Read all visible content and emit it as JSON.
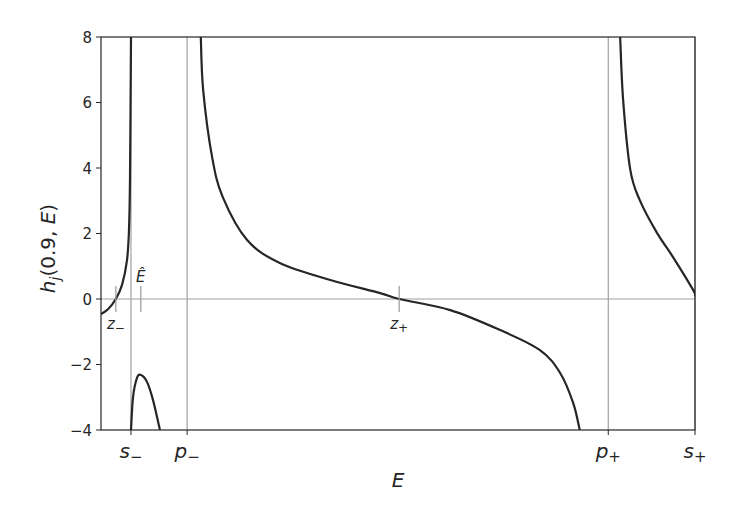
{
  "chart_data": {
    "type": "line",
    "title": "",
    "xlabel": "E",
    "ylabel": "h_j(0.9, E)",
    "ylabel_parts": {
      "h": "h",
      "sub": "j",
      "args": "(0.9, ",
      "var": "E",
      "close": ")"
    },
    "xlim": [
      0,
      100
    ],
    "ylim": [
      -4,
      8
    ],
    "x_units": "arbitrary (positions relative to axis span)",
    "yticks": [
      -4,
      -2,
      0,
      2,
      4,
      6,
      8
    ],
    "ytick_labels": [
      "−4",
      "−2",
      "0",
      "2",
      "4",
      "6",
      "8"
    ],
    "xticks": [
      {
        "x": 5.05,
        "label": "s",
        "sub": "−"
      },
      {
        "x": 14.5,
        "label": "p",
        "sub": "−"
      },
      {
        "x": 85.4,
        "label": "p",
        "sub": "+"
      },
      {
        "x": 100,
        "label": "s",
        "sub": "+"
      }
    ],
    "reference_lines": {
      "horizontal": [
        0
      ],
      "vertical": [
        5.05,
        14.5,
        85.4,
        100
      ]
    },
    "annotations": [
      {
        "x": 2.5,
        "y": 0,
        "label": "z",
        "sub": "−",
        "position": "below"
      },
      {
        "x": 6.7,
        "y": 0,
        "label": "Ê",
        "sub": "",
        "position": "above"
      },
      {
        "x": 50.2,
        "y": 0,
        "label": "z",
        "sub": "+",
        "position": "below"
      }
    ],
    "grid": false,
    "legend": "none",
    "series": [
      {
        "name": "branch-left",
        "x": [
          0,
          1.18,
          2.5,
          3.54,
          4.38,
          4.71,
          4.88,
          5.05
        ],
        "y": [
          -0.46,
          -0.31,
          0,
          0.43,
          1.19,
          2.1,
          3.63,
          8
        ]
      },
      {
        "name": "branch-hump",
        "x": [
          5.05,
          5.39,
          6.06,
          6.73,
          7.74,
          8.75,
          9.93
        ],
        "y": [
          -4,
          -3.0,
          -2.41,
          -2.32,
          -2.53,
          -3.08,
          -4
        ]
      },
      {
        "name": "branch-middle",
        "x": [
          16.8,
          17.2,
          18.7,
          20.5,
          24.6,
          30.1,
          38.6,
          47.0,
          50.2,
          58.8,
          67.2,
          73.9,
          77.3,
          79.5,
          80.6
        ],
        "y": [
          8,
          6.38,
          4.34,
          3.11,
          1.8,
          1.1,
          0.58,
          0.18,
          0,
          -0.34,
          -0.95,
          -1.56,
          -2.26,
          -3.18,
          -4
        ]
      },
      {
        "name": "branch-right",
        "x": [
          87.4,
          87.9,
          89.1,
          90.7,
          93.6,
          96.3,
          99.7,
          100
        ],
        "y": [
          8,
          6.08,
          3.95,
          3.02,
          2.02,
          1.28,
          0.27,
          0.09
        ]
      }
    ],
    "colors": {
      "curve": "#262626",
      "reference": "#a0a0a0",
      "axis": "#262626"
    }
  }
}
